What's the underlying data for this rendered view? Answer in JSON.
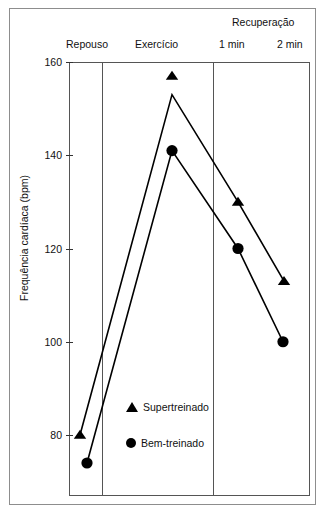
{
  "chart_data": {
    "type": "line",
    "title": "",
    "xlabel": "",
    "ylabel": "Frequência cardíaca (bpm)",
    "ylim": [
      60,
      160
    ],
    "yticks": [
      160,
      140,
      120,
      100,
      80
    ],
    "ytick_labels": [
      "160",
      "140",
      "120",
      "100",
      "80"
    ],
    "grid": false,
    "legend_position": "inside-bottom-center",
    "categories": [
      "Repouso",
      "Exercício",
      "1 min",
      "2 min"
    ],
    "x_group_header": "Recuperação",
    "x_group_header_spans": [
      "1 min",
      "2 min"
    ],
    "series": [
      {
        "name": "Supertreinado",
        "marker": "triangle",
        "color": "#000000",
        "values": [
          80,
          153,
          130,
          113
        ],
        "marker_values": [
          80,
          157,
          130,
          113
        ]
      },
      {
        "name": "Bem-treinado",
        "marker": "circle",
        "color": "#000000",
        "values": [
          74,
          141,
          120,
          100
        ],
        "marker_values": [
          74,
          141,
          120,
          100
        ]
      }
    ],
    "annotations": []
  },
  "axis": {
    "y_title": "Frequência cardíaca (bpm)",
    "ticks": [
      {
        "label": "160",
        "value": 160
      },
      {
        "label": "140",
        "value": 140
      },
      {
        "label": "120",
        "value": 120
      },
      {
        "label": "100",
        "value": 100
      },
      {
        "label": "80",
        "value": 80
      }
    ]
  },
  "top_labels": {
    "recovery_group": "Recuperação",
    "rest": "Repouso",
    "exercise": "Exercício",
    "recovery_1min": "1 min",
    "recovery_2min": "2 min"
  },
  "legend": {
    "items": [
      {
        "marker": "triangle-marker",
        "label": "Supertreinado"
      },
      {
        "marker": "circle-marker",
        "label": "Bem-treinado"
      }
    ]
  }
}
